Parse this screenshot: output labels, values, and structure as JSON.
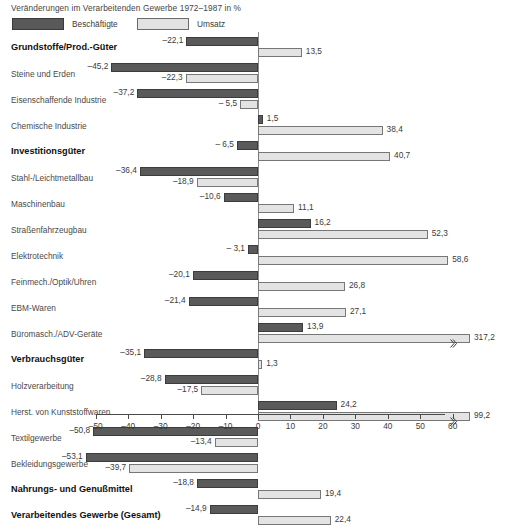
{
  "title": "Veränderungen im Verarbeitenden Gewerbe 1972–1987 in %",
  "legend": {
    "position": "top-left",
    "items": [
      {
        "label": "Beschäftigte",
        "color": "#5a5a5a",
        "key": "employees"
      },
      {
        "label": "Umsatz",
        "color": "#e3e3e3",
        "key": "turnover"
      }
    ]
  },
  "chart_data": {
    "type": "bar",
    "orientation": "horizontal",
    "title": "Veränderungen im Verarbeitenden Gewerbe 1972–1987 in %",
    "xlabel": "",
    "ylabel": "",
    "xlim": [
      -50,
      60
    ],
    "xticks": [
      -50,
      -40,
      -30,
      -20,
      -10,
      0,
      10,
      20,
      30,
      40,
      50,
      60
    ],
    "xticklabels": [
      "–50",
      "–40",
      "–30",
      "–20",
      "–10",
      "0",
      "10",
      "20",
      "30",
      "40",
      "50",
      "60"
    ],
    "grid": false,
    "legend": [
      "Beschäftigte",
      "Umsatz"
    ],
    "note": "Balken mit Unterbrechungszeichen sind gekürzt dargestellt (317,2 und 99,2).",
    "categories": [
      "Grundstoffe/Prod.-Güter",
      "Steine und Erden",
      "Eisenschaffende Industrie",
      "Chemische Industrie",
      "Investitionsgüter",
      "Stahl-/Leichtmetallbau",
      "Maschinenbau",
      "Straßenfahrzeugbau",
      "Elektrotechnik",
      "Feinmech./Optik/Uhren",
      "EBM-Waren",
      "Büromasch./ADV-Geräte",
      "Verbrauchsgüter",
      "Holzverarbeitung",
      "Herst. von Kunststoffwaren",
      "Textilgewerbe",
      "Bekleidungsgewerbe",
      "Nahrungs- und Genußmittel",
      "Verarbeitendes Gewerbe (Gesamt)"
    ],
    "series": [
      {
        "name": "Beschäftigte",
        "values": [
          -22.1,
          -45.2,
          -37.2,
          1.5,
          -6.5,
          -36.4,
          -10.6,
          16.2,
          -3.1,
          -20.1,
          -21.4,
          13.9,
          -35.1,
          -28.8,
          24.2,
          -50.8,
          -53.1,
          -18.8,
          -14.9
        ]
      },
      {
        "name": "Umsatz",
        "values": [
          13.5,
          -22.3,
          -5.5,
          38.4,
          40.7,
          -18.9,
          11.1,
          52.3,
          58.6,
          26.8,
          27.1,
          317.2,
          1.3,
          -17.5,
          99.2,
          -13.4,
          -39.7,
          19.4,
          22.4
        ]
      }
    ]
  },
  "rows": [
    {
      "label": "Grundstoffe/Prod.-Güter",
      "group": true,
      "emp": -22.1,
      "tur": 13.5,
      "emp_label": "–22,1",
      "tur_label": "13,5"
    },
    {
      "label": "Steine und Erden",
      "group": false,
      "emp": -45.2,
      "tur": -22.3,
      "emp_label": "–45,2",
      "tur_label": "–22,3"
    },
    {
      "label": "Eisenschaffende Industrie",
      "group": false,
      "emp": -37.2,
      "tur": -5.5,
      "emp_label": "–37,2",
      "tur_label": "– 5,5"
    },
    {
      "label": "Chemische Industrie",
      "group": false,
      "emp": 1.5,
      "tur": 38.4,
      "emp_label": "1,5",
      "tur_label": "38,4"
    },
    {
      "label": "Investitionsgüter",
      "group": true,
      "emp": -6.5,
      "tur": 40.7,
      "emp_label": "– 6,5",
      "tur_label": "40,7"
    },
    {
      "label": "Stahl-/Leichtmetallbau",
      "group": false,
      "emp": -36.4,
      "tur": -18.9,
      "emp_label": "–36,4",
      "tur_label": "–18,9"
    },
    {
      "label": "Maschinenbau",
      "group": false,
      "emp": -10.6,
      "tur": 11.1,
      "emp_label": "–10,6",
      "tur_label": "11,1"
    },
    {
      "label": "Straßenfahrzeugbau",
      "group": false,
      "emp": 16.2,
      "tur": 52.3,
      "emp_label": "16,2",
      "tur_label": "52,3"
    },
    {
      "label": "Elektrotechnik",
      "group": false,
      "emp": -3.1,
      "tur": 58.6,
      "emp_label": "– 3,1",
      "tur_label": "58,6"
    },
    {
      "label": "Feinmech./Optik/Uhren",
      "group": false,
      "emp": -20.1,
      "tur": 26.8,
      "emp_label": "–20,1",
      "tur_label": "26,8"
    },
    {
      "label": "EBM-Waren",
      "group": false,
      "emp": -21.4,
      "tur": 27.1,
      "emp_label": "–21,4",
      "tur_label": "27,1"
    },
    {
      "label": "Büromasch./ADV-Geräte",
      "group": false,
      "emp": 13.9,
      "tur": 317.2,
      "emp_label": "13,9",
      "tur_label": "317,2",
      "tur_break": true
    },
    {
      "label": "Verbrauchsgüter",
      "group": true,
      "emp": -35.1,
      "tur": 1.3,
      "emp_label": "–35,1",
      "tur_label": "1,3"
    },
    {
      "label": "Holzverarbeitung",
      "group": false,
      "emp": -28.8,
      "tur": -17.5,
      "emp_label": "–28,8",
      "tur_label": "–17,5"
    },
    {
      "label": "Herst. von Kunststoffwaren",
      "group": false,
      "emp": 24.2,
      "tur": 99.2,
      "emp_label": "24,2",
      "tur_label": "99,2",
      "tur_break": true
    },
    {
      "label": "Textilgewerbe",
      "group": false,
      "emp": -50.8,
      "tur": -13.4,
      "emp_label": "–50,8",
      "tur_label": "–13,4"
    },
    {
      "label": "Bekleidungsgewerbe",
      "group": false,
      "emp": -53.1,
      "tur": -39.7,
      "emp_label": "–53,1",
      "tur_label": "–39,7"
    },
    {
      "label": "Nahrungs- und Genußmittel",
      "group": true,
      "emp": -18.8,
      "tur": 19.4,
      "emp_label": "–18,8",
      "tur_label": "19,4"
    },
    {
      "label": "Verarbeitendes Gewerbe (Gesamt)",
      "group": true,
      "emp": -14.9,
      "tur": 22.4,
      "emp_label": "–14,9",
      "tur_label": "22,4"
    }
  ],
  "axis": {
    "ticks": [
      "–50",
      "–40",
      "–30",
      "–20",
      "–10",
      "0",
      "10",
      "20",
      "30",
      "40",
      "50",
      "60"
    ],
    "values": [
      -50,
      -40,
      -30,
      -20,
      -10,
      0,
      10,
      20,
      30,
      40,
      50,
      60
    ]
  },
  "colors": {
    "employees": "#5a5a5a",
    "turnover": "#e3e3e3",
    "axis": "#4a4a4a",
    "text": "#3b3b3b"
  }
}
